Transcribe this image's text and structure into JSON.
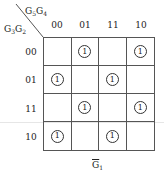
{
  "kmap": {
    "col_var": {
      "base": "G",
      "sub1": "5",
      "sub2": "4"
    },
    "row_var": {
      "base": "G",
      "sub1": "3",
      "sub2": "2"
    },
    "col_headers": [
      "00",
      "01",
      "11",
      "10"
    ],
    "row_headers": [
      "00",
      "01",
      "11",
      "10"
    ],
    "cells": [
      [
        "",
        "1",
        "",
        "1"
      ],
      [
        "1",
        "",
        "1",
        ""
      ],
      [
        "",
        "1",
        "",
        "1"
      ],
      [
        "1",
        "",
        "1",
        ""
      ]
    ],
    "caption": {
      "base": "G",
      "sub": "1",
      "negated": true
    }
  },
  "colors": {
    "line": "#555555",
    "text": "#222222",
    "background": "#ffffff"
  }
}
